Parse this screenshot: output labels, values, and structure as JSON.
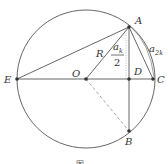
{
  "diagram": {
    "type": "geometry",
    "colors": {
      "stroke": "#555555",
      "point": "#333333",
      "dashed": "#888888",
      "background": "#ffffff"
    },
    "circle": {
      "center": "O",
      "cx": 86,
      "cy": 79,
      "r": 69
    },
    "points": [
      {
        "name": "A",
        "x": 129,
        "y": 27
      },
      {
        "name": "B",
        "x": 129,
        "y": 131
      },
      {
        "name": "C",
        "x": 153,
        "y": 79
      },
      {
        "name": "D",
        "x": 129,
        "y": 79
      },
      {
        "name": "E",
        "x": 17,
        "y": 79
      },
      {
        "name": "O",
        "x": 86,
        "y": 79
      }
    ],
    "labels": {
      "A": "A",
      "B": "B",
      "C": "C",
      "D": "D",
      "E": "E",
      "O": "O",
      "R": "R",
      "ak_half_num": "a",
      "ak_half_sub": "k",
      "ak_half_den": "2",
      "a2k": "a",
      "a2k_sub": "2k"
    },
    "segments": [
      {
        "from": "E",
        "to": "C",
        "style": "solid"
      },
      {
        "from": "E",
        "to": "A",
        "style": "solid"
      },
      {
        "from": "O",
        "to": "A",
        "style": "solid",
        "label": "R"
      },
      {
        "from": "A",
        "to": "B",
        "style": "solid"
      },
      {
        "from": "A",
        "to": "C",
        "style": "solid",
        "label": "a_2k"
      },
      {
        "from": "O",
        "to": "B",
        "style": "dashed"
      }
    ],
    "caption": "图"
  }
}
